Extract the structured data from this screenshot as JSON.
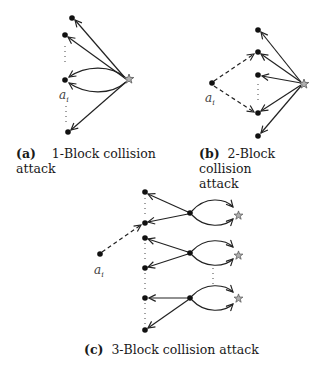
{
  "figure": {
    "panels": [
      {
        "id": "a",
        "tag": "(a)",
        "title": "1-Block collision",
        "title_line2": "attack",
        "node_label": "a",
        "node_label_sub": "i"
      },
      {
        "id": "b",
        "tag": "(b)",
        "title": "2-Block collision",
        "title_line2": "attack",
        "node_label": "a",
        "node_label_sub": "i"
      },
      {
        "id": "c",
        "tag": "(c)",
        "title": "3-Block collision attack",
        "node_label": "a",
        "node_label_sub": "i"
      }
    ],
    "colors": {
      "edge": "#222222",
      "node": "#111111",
      "star_fill": "#b0b0b0",
      "star_stroke": "#555555"
    }
  }
}
